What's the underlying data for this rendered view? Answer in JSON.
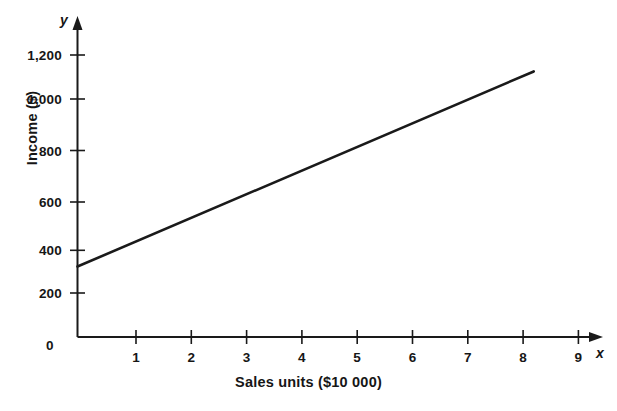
{
  "chart_data": {
    "type": "line",
    "title": "",
    "xlabel": "Sales units ($10 000)",
    "ylabel": "Income ($)",
    "x_axis_variable": "x",
    "y_axis_variable": "y",
    "origin_label": "0",
    "xlim": [
      0,
      9.4
    ],
    "ylim": [
      0,
      1300
    ],
    "xticks": [
      1,
      2,
      3,
      4,
      5,
      6,
      7,
      8,
      9
    ],
    "xtick_labels": [
      "1",
      "2",
      "3",
      "4",
      "5",
      "6",
      "7",
      "8",
      "9"
    ],
    "yticks": [
      200,
      400,
      600,
      800,
      1000,
      1200
    ],
    "ytick_labels": [
      "200",
      "400",
      "600",
      "800",
      "1,000",
      "1,200"
    ],
    "grid": false,
    "legend": null,
    "series": [
      {
        "name": "Income vs sales units",
        "color": "#1a1a1a",
        "x": [
          0,
          8.25
        ],
        "values": [
          300,
          1130
        ],
        "slope": 100.6,
        "intercept": 300
      }
    ],
    "annotations": []
  },
  "figure": {
    "background_color": "#ffffff",
    "axis_color": "#1a1a1a",
    "line_color": "#1a1a1a"
  }
}
